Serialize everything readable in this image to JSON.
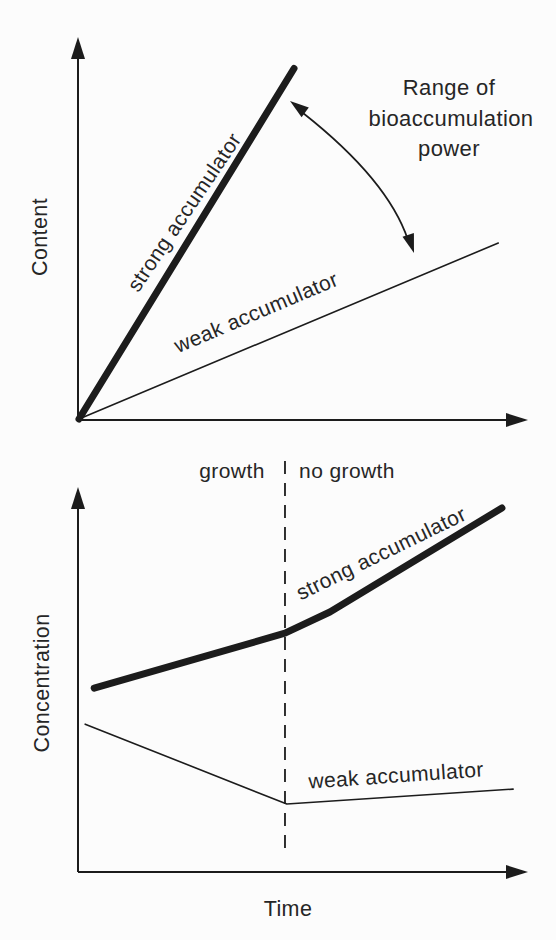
{
  "figure": {
    "background": "#fcfcfc",
    "ink": "#1c1c1c",
    "top_chart": {
      "ylabel": "Content",
      "strong_label": "strong accumulator",
      "weak_label": "weak accumulator",
      "annotation_line1": "Range of",
      "annotation_line2": "bioaccumulation",
      "annotation_line3": "power"
    },
    "bottom_chart": {
      "ylabel": "Concentration",
      "xlabel": "Time",
      "region_left": "growth",
      "region_right": "no growth",
      "strong_label": "strong accumulator",
      "weak_label": "weak accumulator"
    }
  },
  "chart_data": [
    {
      "type": "line",
      "title": "",
      "xlabel": "",
      "ylabel": "Content",
      "axes": "qualitative, no ticks, arrowed axes",
      "xlim": [
        0,
        1
      ],
      "ylim": [
        0,
        1
      ],
      "grid": false,
      "series": [
        {
          "name": "strong accumulator",
          "style": "thick",
          "x": [
            0,
            0.48
          ],
          "y": [
            0,
            0.92
          ]
        },
        {
          "name": "weak accumulator",
          "style": "thin",
          "x": [
            0,
            0.936
          ],
          "y": [
            0,
            0.462
          ]
        }
      ],
      "annotation": {
        "text": "Range of bioaccumulation power",
        "arrow": "curved double-headed arrow spanning from strong-accumulator line to weak-accumulator line"
      }
    },
    {
      "type": "line",
      "title": "",
      "xlabel": "Time",
      "ylabel": "Concentration",
      "axes": "qualitative, no ticks, arrowed axes",
      "xlim": [
        0,
        1
      ],
      "ylim": [
        0,
        1
      ],
      "grid": false,
      "divider_x": 0.461,
      "regions": [
        {
          "label": "growth",
          "x_range": [
            0,
            0.461
          ]
        },
        {
          "label": "no growth",
          "x_range": [
            0.461,
            1
          ]
        }
      ],
      "series": [
        {
          "name": "strong accumulator",
          "style": "thick",
          "x": [
            0.036,
            0.461,
            0.561,
            0.944
          ],
          "y": [
            0.479,
            0.622,
            0.677,
            0.948
          ]
        },
        {
          "name": "weak accumulator",
          "style": "thin",
          "x": [
            0.016,
            0.465,
            0.969
          ],
          "y": [
            0.385,
            0.177,
            0.216
          ]
        }
      ]
    }
  ]
}
